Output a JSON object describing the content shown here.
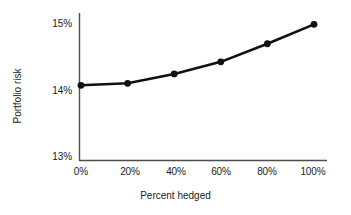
{
  "chart_data": {
    "type": "line",
    "title": "",
    "xlabel": "Percent hedged",
    "ylabel": "Portfolio risk",
    "x": [
      0,
      20,
      40,
      60,
      80,
      100
    ],
    "xtick_labels": [
      "0%",
      "20%",
      "40%",
      "60%",
      "80%",
      "100%"
    ],
    "values": [
      14.07,
      14.1,
      14.24,
      14.42,
      14.69,
      14.98
    ],
    "ytick_labels": [
      "15%",
      "14%",
      "13%"
    ],
    "ytick_values": [
      15,
      14,
      13
    ],
    "xlim": [
      0,
      100
    ],
    "ylim": [
      12.9,
      15.1
    ],
    "grid": false,
    "legend": false,
    "legend_position": "none",
    "series": [
      {
        "name": "Portfolio risk",
        "values": [
          14.07,
          14.1,
          14.24,
          14.42,
          14.69,
          14.98
        ]
      }
    ],
    "marker": "filled-circle",
    "line_color": "#111111",
    "marker_color": "#111111",
    "axis_color": "#555555",
    "background": "#ffffff"
  },
  "axes": {
    "y_title": "Portfolio risk",
    "x_title": "Percent hedged",
    "y_ticks": [
      {
        "label": "15%",
        "value": 15
      },
      {
        "label": "14%",
        "value": 14
      },
      {
        "label": "13%",
        "value": 13
      }
    ],
    "x_ticks": [
      {
        "label": "0%",
        "value": 0
      },
      {
        "label": "20%",
        "value": 20
      },
      {
        "label": "40%",
        "value": 40
      },
      {
        "label": "60%",
        "value": 60
      },
      {
        "label": "80%",
        "value": 80
      },
      {
        "label": "100%",
        "value": 100
      }
    ]
  }
}
